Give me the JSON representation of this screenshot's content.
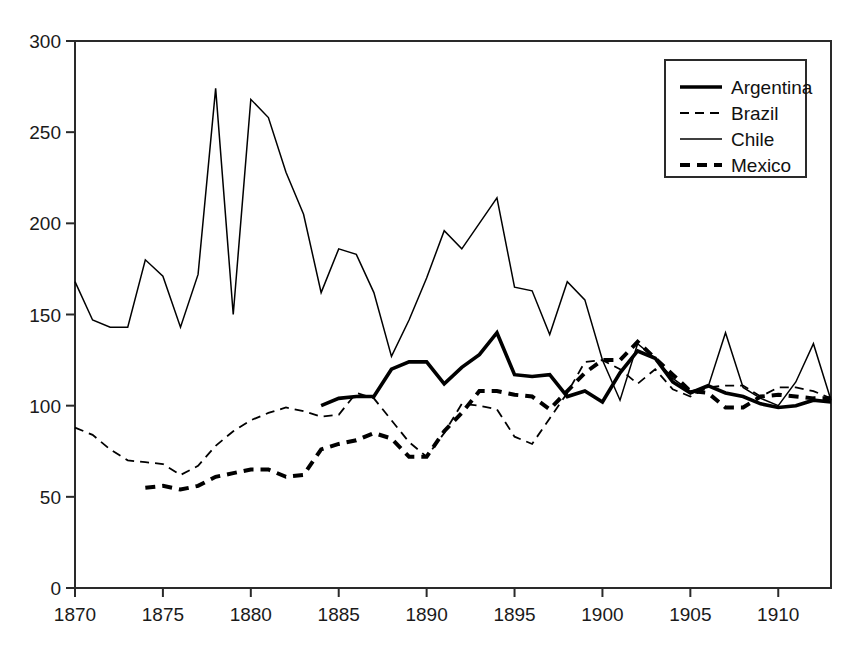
{
  "chart_data": {
    "type": "line",
    "title": "",
    "subtitle": "",
    "xlabel": "",
    "ylabel": "",
    "xlim": [
      1870,
      1913
    ],
    "ylim": [
      0,
      300
    ],
    "xticks": [
      1870,
      1875,
      1880,
      1885,
      1890,
      1895,
      1900,
      1905,
      1910
    ],
    "yticks": [
      0,
      50,
      100,
      150,
      200,
      250,
      300
    ],
    "grid": false,
    "legend_position": "top-right",
    "series": [
      {
        "name": "Argentina",
        "style": "solid-thick",
        "color": "#000000",
        "x": [
          1884,
          1885,
          1886,
          1887,
          1888,
          1889,
          1890,
          1891,
          1892,
          1893,
          1894,
          1895,
          1896,
          1897,
          1898,
          1899,
          1900,
          1901,
          1902,
          1903,
          1904,
          1905,
          1906,
          1907,
          1908,
          1909,
          1910,
          1911,
          1912,
          1913
        ],
        "y": [
          100,
          104,
          105,
          105,
          120,
          124,
          124,
          112,
          121,
          128,
          140,
          117,
          116,
          117,
          105,
          108,
          102,
          118,
          130,
          126,
          113,
          107,
          111,
          107,
          105,
          101,
          99,
          100,
          103,
          102
        ]
      },
      {
        "name": "Brazil",
        "style": "dashed-thin",
        "color": "#000000",
        "x": [
          1870,
          1871,
          1872,
          1873,
          1874,
          1875,
          1876,
          1877,
          1878,
          1879,
          1880,
          1881,
          1882,
          1883,
          1884,
          1885,
          1886,
          1887,
          1888,
          1889,
          1890,
          1891,
          1892,
          1893,
          1894,
          1895,
          1896,
          1897,
          1898,
          1899,
          1900,
          1901,
          1902,
          1903,
          1904,
          1905,
          1906,
          1907,
          1908,
          1909,
          1910,
          1911,
          1912,
          1913
        ],
        "y": [
          88,
          84,
          76,
          70,
          69,
          68,
          62,
          67,
          78,
          86,
          92,
          96,
          99,
          97,
          94,
          95,
          107,
          104,
          92,
          80,
          72,
          85,
          101,
          100,
          98,
          83,
          79,
          93,
          107,
          124,
          125,
          120,
          112,
          120,
          109,
          105,
          110,
          111,
          111,
          105,
          110,
          110,
          108,
          104
        ]
      },
      {
        "name": "Chile",
        "style": "solid-thin",
        "color": "#000000",
        "x": [
          1870,
          1871,
          1872,
          1873,
          1874,
          1875,
          1876,
          1877,
          1878,
          1879,
          1880,
          1881,
          1882,
          1883,
          1884,
          1885,
          1886,
          1887,
          1888,
          1889,
          1890,
          1891,
          1892,
          1893,
          1894,
          1895,
          1896,
          1897,
          1898,
          1899,
          1900,
          1901,
          1902,
          1903,
          1904,
          1905,
          1906,
          1907,
          1908,
          1909,
          1910,
          1911,
          1912,
          1913
        ],
        "y": [
          168,
          147,
          143,
          143,
          180,
          171,
          143,
          172,
          274,
          150,
          268,
          258,
          228,
          205,
          162,
          186,
          183,
          162,
          127,
          147,
          170,
          196,
          186,
          200,
          214,
          165,
          163,
          139,
          168,
          158,
          125,
          103,
          134,
          126,
          115,
          108,
          110,
          140,
          110,
          104,
          100,
          113,
          134,
          103
        ]
      },
      {
        "name": "Mexico",
        "style": "dashed-thick",
        "color": "#000000",
        "x": [
          1874,
          1875,
          1876,
          1877,
          1878,
          1879,
          1880,
          1881,
          1882,
          1883,
          1884,
          1885,
          1886,
          1887,
          1888,
          1889,
          1890,
          1891,
          1892,
          1893,
          1894,
          1895,
          1896,
          1897,
          1898,
          1899,
          1900,
          1901,
          1902,
          1903,
          1904,
          1905,
          1906,
          1907,
          1908,
          1909,
          1910,
          1911,
          1912,
          1913
        ],
        "y": [
          55,
          56,
          54,
          56,
          61,
          63,
          65,
          65,
          61,
          62,
          76,
          79,
          81,
          85,
          82,
          72,
          72,
          86,
          96,
          108,
          108,
          106,
          105,
          98,
          108,
          118,
          125,
          125,
          135,
          126,
          117,
          108,
          107,
          99,
          99,
          105,
          106,
          105,
          104,
          104
        ]
      }
    ]
  },
  "axes": {
    "x_tick_labels": [
      "1870",
      "1875",
      "1880",
      "1885",
      "1890",
      "1895",
      "1900",
      "1905",
      "1910"
    ],
    "y_tick_labels": [
      "0",
      "50",
      "100",
      "150",
      "200",
      "250",
      "300"
    ]
  },
  "legend": {
    "entries": [
      {
        "label": "Argentina",
        "style": "solid-thick"
      },
      {
        "label": "Brazil",
        "style": "dashed-thin"
      },
      {
        "label": "Chile",
        "style": "solid-thin"
      },
      {
        "label": "Mexico",
        "style": "dashed-thick"
      }
    ]
  },
  "colors": {
    "ink": "#000000",
    "background": "#ffffff"
  }
}
